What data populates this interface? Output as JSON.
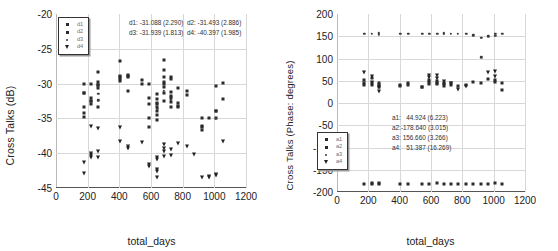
{
  "figure": {
    "panels": [
      {
        "id": "magnitude",
        "ylabel": "Cross Talks (dB)",
        "xlabel": "total_days",
        "legend": [
          {
            "label": "d1",
            "marker": "square"
          },
          {
            "label": "d2",
            "marker": "square"
          },
          {
            "label": "d3",
            "marker": "dot"
          },
          {
            "label": "d4",
            "marker": "triangle-down"
          }
        ],
        "stats_lines": [
          "d1: -31.088 (2.290)  d2: -31.493 (2.886)",
          "d3: -31.939 (1.813)  d4: -40.397 (1.985)"
        ],
        "stats": [
          {
            "series": "d1",
            "mean": -31.088,
            "sd": 2.29
          },
          {
            "series": "d2",
            "mean": -31.493,
            "sd": 2.886
          },
          {
            "series": "d3",
            "mean": -31.939,
            "sd": 1.813
          },
          {
            "series": "d4",
            "mean": -40.397,
            "sd": 1.985
          }
        ]
      },
      {
        "id": "phase",
        "ylabel": "Cross Talks (Phase: degrees)",
        "xlabel": "total_days",
        "legend": [
          {
            "label": "a1",
            "marker": "square"
          },
          {
            "label": "a2",
            "marker": "square"
          },
          {
            "label": "a3",
            "marker": "dot"
          },
          {
            "label": "a4",
            "marker": "triangle-down"
          }
        ],
        "stats_lines": [
          "a1:   44.924 (6.223)",
          "a2:-178.640 (3.015)",
          "a3: 156.660 (3.266)",
          "a4:   51.387 (16.269)"
        ],
        "stats": [
          {
            "series": "a1",
            "mean": 44.924,
            "sd": 6.223
          },
          {
            "series": "a2",
            "mean": -178.64,
            "sd": 3.015
          },
          {
            "series": "a3",
            "mean": 156.66,
            "sd": 3.266
          },
          {
            "series": "a4",
            "mean": 51.387,
            "sd": 16.269
          }
        ]
      }
    ]
  },
  "chart_data": [
    {
      "type": "scatter",
      "title": "",
      "xlabel": "total_days",
      "ylabel": "Cross Talks (dB)",
      "xlim": [
        0,
        1200
      ],
      "ylim": [
        -45,
        -20
      ],
      "xticks": [
        0,
        200,
        400,
        600,
        800,
        1000,
        1200
      ],
      "yticks": [
        -20,
        -25,
        -30,
        -35,
        -40,
        -45
      ],
      "grid": true,
      "legend_position": "upper-left",
      "series": [
        {
          "name": "d1",
          "marker": "square",
          "points": [
            [
              175,
              -30.1
            ],
            [
              175,
              -31.3
            ],
            [
              175,
              -33.4
            ],
            [
              175,
              -34.2
            ],
            [
              175,
              -34.8
            ],
            [
              222,
              -30.0
            ],
            [
              222,
              -32.1
            ],
            [
              222,
              -32.5
            ],
            [
              222,
              -33.0
            ],
            [
              268,
              -28.4
            ],
            [
              268,
              -29.8
            ],
            [
              268,
              -30.2
            ],
            [
              268,
              -30.6
            ],
            [
              268,
              -33.3
            ],
            [
              405,
              -28.9
            ],
            [
              405,
              -29.1
            ],
            [
              405,
              -29.6
            ],
            [
              405,
              -26.8
            ],
            [
              455,
              -28.7
            ],
            [
              455,
              -29.0
            ],
            [
              455,
              -31.1
            ],
            [
              545,
              -29.5
            ],
            [
              545,
              -30.0
            ],
            [
              590,
              -30.0
            ],
            [
              590,
              -32.0
            ],
            [
              590,
              -35.0
            ],
            [
              590,
              -36.2
            ],
            [
              640,
              -31.5
            ],
            [
              640,
              -32.2
            ],
            [
              640,
              -32.8
            ],
            [
              640,
              -33.3
            ],
            [
              640,
              -33.9
            ],
            [
              640,
              -34.5
            ],
            [
              640,
              -35.2
            ],
            [
              680,
              -26.6
            ],
            [
              680,
              -28.0
            ],
            [
              680,
              -29.0
            ],
            [
              680,
              -29.8
            ],
            [
              680,
              -30.5
            ],
            [
              680,
              -31.3
            ],
            [
              680,
              -32.5
            ],
            [
              725,
              -29.0
            ],
            [
              725,
              -29.4
            ],
            [
              725,
              -31.2
            ],
            [
              725,
              -31.8
            ],
            [
              725,
              -32.6
            ],
            [
              725,
              -33.4
            ],
            [
              770,
              -30.6
            ],
            [
              770,
              -32.8
            ],
            [
              770,
              -33.3
            ],
            [
              825,
              -31.0
            ],
            [
              825,
              -31.6
            ],
            [
              920,
              -34.9
            ],
            [
              920,
              -36.1
            ],
            [
              920,
              -36.7
            ],
            [
              965,
              -34.9
            ],
            [
              1010,
              -30.3
            ],
            [
              1010,
              -33.9
            ],
            [
              1010,
              -34.9
            ],
            [
              1055,
              -29.9
            ],
            [
              1055,
              -32.2
            ]
          ]
        },
        {
          "name": "d2",
          "marker": "square",
          "points": [
            [
              175,
              -31.3
            ],
            [
              222,
              -32.5
            ],
            [
              268,
              -30.2
            ],
            [
              405,
              -29.3
            ],
            [
              455,
              -28.9
            ],
            [
              590,
              -33.0
            ],
            [
              640,
              -33.0
            ],
            [
              680,
              -30.0
            ],
            [
              725,
              -32.0
            ],
            [
              770,
              -33.2
            ],
            [
              920,
              -36.2
            ],
            [
              1010,
              -34.0
            ]
          ]
        },
        {
          "name": "d3",
          "marker": "dot",
          "points": [
            [
              268,
              -31.5
            ],
            [
              268,
              -32.4
            ],
            [
              640,
              -33.6
            ],
            [
              680,
              -31.0
            ],
            [
              725,
              -32.4
            ],
            [
              1010,
              -35.0
            ]
          ]
        },
        {
          "name": "d4",
          "marker": "triangle-down",
          "points": [
            [
              175,
              -41.3
            ],
            [
              175,
              -42.9
            ],
            [
              222,
              -36.1
            ],
            [
              222,
              -39.9
            ],
            [
              222,
              -40.3
            ],
            [
              222,
              -40.6
            ],
            [
              268,
              -36.4
            ],
            [
              268,
              -39.7
            ],
            [
              268,
              -40.5
            ],
            [
              405,
              -36.3
            ],
            [
              405,
              -38.2
            ],
            [
              455,
              -39.0
            ],
            [
              455,
              -39.3
            ],
            [
              545,
              -38.4
            ],
            [
              590,
              -41.6
            ],
            [
              590,
              -41.9
            ],
            [
              640,
              -40.6
            ],
            [
              640,
              -40.9
            ],
            [
              640,
              -42.3
            ],
            [
              640,
              -42.6
            ],
            [
              640,
              -43.4
            ],
            [
              680,
              -38.7
            ],
            [
              680,
              -39.3
            ],
            [
              680,
              -39.7
            ],
            [
              680,
              -40.4
            ],
            [
              725,
              -39.4
            ],
            [
              725,
              -40.3
            ],
            [
              770,
              -38.6
            ],
            [
              825,
              -38.9
            ],
            [
              870,
              -40.1
            ],
            [
              920,
              -43.4
            ],
            [
              965,
              -43.4
            ],
            [
              965,
              -43.3
            ],
            [
              1010,
              -43.0
            ],
            [
              1010,
              -43.2
            ],
            [
              1055,
              -38.2
            ]
          ]
        }
      ]
    },
    {
      "type": "scatter",
      "title": "",
      "xlabel": "total_days",
      "ylabel": "Cross Talks (Phase: degrees)",
      "xlim": [
        0,
        1200
      ],
      "ylim": [
        -200,
        200
      ],
      "xticks": [
        0,
        200,
        400,
        600,
        800,
        1000,
        1200
      ],
      "yticks": [
        200,
        150,
        100,
        50,
        0,
        -50,
        -100,
        -150,
        -200
      ],
      "grid": true,
      "legend_position": "center-left",
      "series": [
        {
          "name": "a1",
          "marker": "square",
          "points": [
            [
              175,
              52
            ],
            [
              175,
              45
            ],
            [
              175,
              40
            ],
            [
              222,
              56
            ],
            [
              222,
              44
            ],
            [
              222,
              41
            ],
            [
              268,
              44
            ],
            [
              268,
              40
            ],
            [
              268,
              37
            ],
            [
              405,
              40
            ],
            [
              405,
              38
            ],
            [
              455,
              44
            ],
            [
              455,
              40
            ],
            [
              545,
              37
            ],
            [
              545,
              35
            ],
            [
              590,
              52
            ],
            [
              590,
              47
            ],
            [
              590,
              43
            ],
            [
              640,
              50
            ],
            [
              640,
              46
            ],
            [
              640,
              42
            ],
            [
              680,
              46
            ],
            [
              680,
              42
            ],
            [
              680,
              38
            ],
            [
              725,
              45
            ],
            [
              725,
              41
            ],
            [
              770,
              38
            ],
            [
              825,
              41
            ],
            [
              870,
              48
            ],
            [
              920,
              46
            ],
            [
              965,
              55
            ],
            [
              1010,
              52
            ],
            [
              1010,
              48
            ],
            [
              1055,
              44
            ],
            [
              1055,
              30
            ]
          ]
        },
        {
          "name": "a2",
          "marker": "square",
          "points": [
            [
              175,
              -181
            ],
            [
              222,
              -180
            ],
            [
              222,
              -182
            ],
            [
              268,
              -180
            ],
            [
              268,
              -183
            ],
            [
              405,
              -181
            ],
            [
              455,
              -181
            ],
            [
              545,
              -182
            ],
            [
              590,
              -181
            ],
            [
              640,
              -180
            ],
            [
              680,
              -181
            ],
            [
              725,
              -182
            ],
            [
              770,
              -181
            ],
            [
              825,
              -182
            ],
            [
              870,
              -181
            ],
            [
              920,
              -182
            ],
            [
              965,
              -181
            ],
            [
              1010,
              -180
            ],
            [
              1055,
              -182
            ]
          ]
        },
        {
          "name": "a3",
          "marker": "dot",
          "points": [
            [
              175,
              155
            ],
            [
              222,
              156
            ],
            [
              268,
              157
            ],
            [
              268,
              153
            ],
            [
              405,
              156
            ],
            [
              455,
              155
            ],
            [
              545,
              156
            ],
            [
              590,
              155
            ],
            [
              640,
              156
            ],
            [
              680,
              155
            ],
            [
              680,
              157
            ],
            [
              725,
              155
            ],
            [
              770,
              156
            ],
            [
              825,
              155
            ],
            [
              870,
              152
            ],
            [
              920,
              146
            ],
            [
              920,
              103
            ],
            [
              965,
              150
            ],
            [
              1010,
              155
            ],
            [
              1010,
              151
            ],
            [
              1055,
              155
            ]
          ]
        },
        {
          "name": "a4",
          "marker": "triangle-down",
          "points": [
            [
              175,
              70
            ],
            [
              222,
              60
            ],
            [
              222,
              48
            ],
            [
              268,
              35
            ],
            [
              268,
              26
            ],
            [
              590,
              63
            ],
            [
              590,
              58
            ],
            [
              640,
              62
            ],
            [
              640,
              57
            ],
            [
              680,
              50
            ],
            [
              725,
              45
            ],
            [
              770,
              32
            ],
            [
              825,
              38
            ],
            [
              965,
              70
            ],
            [
              1010,
              72
            ],
            [
              1010,
              60
            ]
          ]
        }
      ]
    }
  ]
}
